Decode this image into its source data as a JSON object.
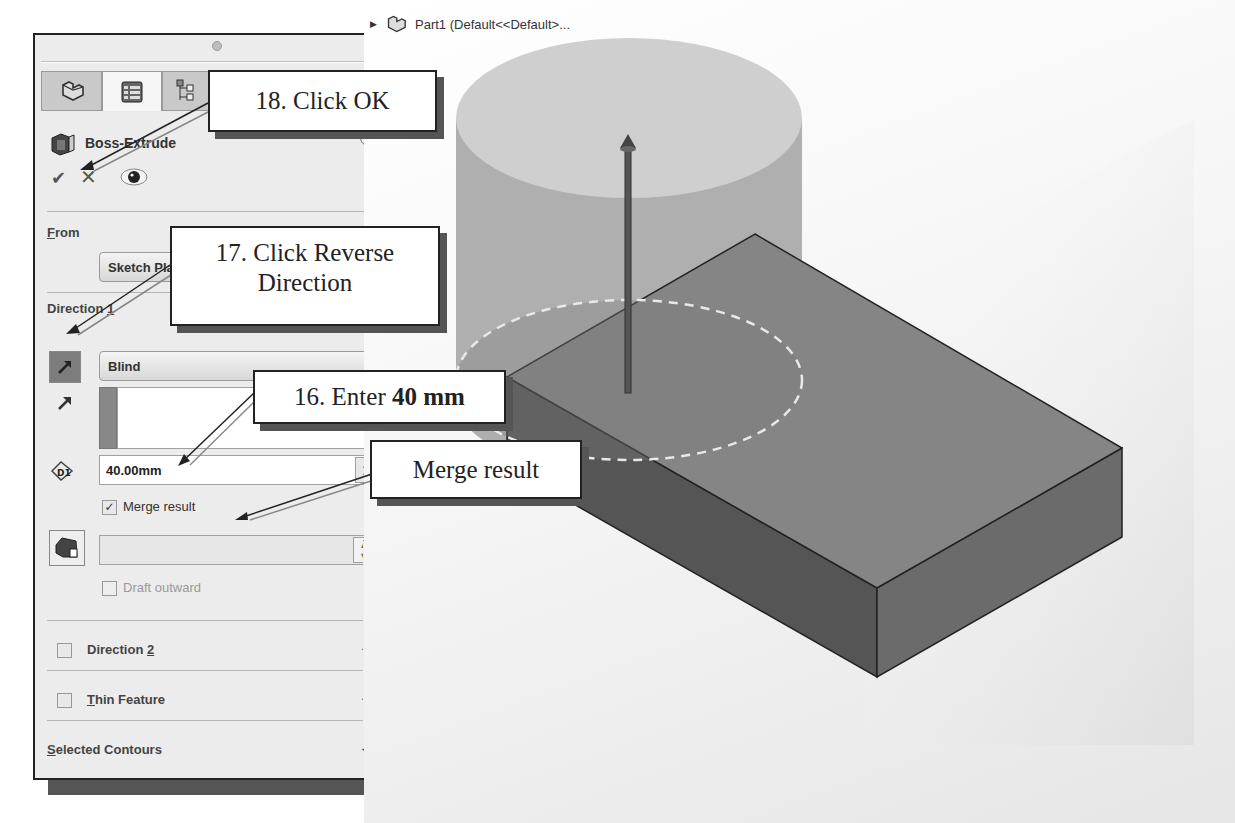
{
  "property_manager": {
    "tabs": [
      {
        "name": "FeatureManager",
        "icon": "part-icon"
      },
      {
        "name": "PropertyManager",
        "icon": "property-list-icon",
        "active": true
      },
      {
        "name": "ConfigurationManager",
        "icon": "configuration-icon"
      }
    ],
    "feature_title": "Boss-Extrude",
    "help_glyph": "?",
    "actions": {
      "ok": "✔",
      "cancel": "✕",
      "preview": "👁"
    },
    "from": {
      "label_prefix": "",
      "label_underline": "F",
      "label_rest": "rom",
      "value": "Sketch Plane"
    },
    "direction1": {
      "label_text": "Direction ",
      "label_underline": "1",
      "end_condition": "Blind",
      "depth": "40.00mm",
      "merge_result_label": "Merge result",
      "merge_result_checked": true,
      "draft_value": "",
      "draft_outward_label": "Draft outward",
      "draft_outward_checked": false
    },
    "sections": [
      {
        "label_text": "Direction ",
        "underline": "2",
        "after": "",
        "checkbox": true
      },
      {
        "label_text": "",
        "underline": "T",
        "after": "hin Feature",
        "checkbox": true
      },
      {
        "label_text": "",
        "underline": "S",
        "after": "elected Contours",
        "checkbox": false
      }
    ]
  },
  "viewport": {
    "tree_item": "Part1  (Default<<Default>...",
    "colors": {
      "box_top": "#8a8a8a",
      "box_left": "#5a5a5a",
      "box_right": "#6e6e6e",
      "cylinder_top": "#cfcfcf",
      "cylinder_side": "#a6a6a6"
    }
  },
  "callouts": {
    "step18": "18. Click OK",
    "step17_line1": "17. Click Reverse",
    "step17_line2": "Direction",
    "step16_prefix": "16. Enter ",
    "step16_bold": "40 mm",
    "merge": "Merge result"
  }
}
